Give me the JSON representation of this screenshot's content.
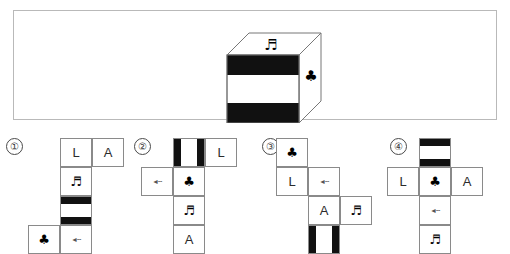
{
  "question": {
    "cube": {
      "top_face_symbol": "♬",
      "front_face": "striped-horizontal",
      "right_face_symbol": "♣"
    }
  },
  "options": [
    {
      "number": "①",
      "cells": [
        {
          "name": "cell-l",
          "type": "letter",
          "text": "L",
          "col": 0,
          "row": 0
        },
        {
          "name": "cell-a",
          "type": "letter",
          "text": "A",
          "col": 1,
          "row": 0
        },
        {
          "name": "cell-note",
          "type": "note",
          "text": "♬",
          "col": 0,
          "row": 1
        },
        {
          "name": "cell-striped",
          "type": "stripes-h",
          "text": "",
          "col": 0,
          "row": 2
        },
        {
          "name": "cell-club",
          "type": "club",
          "text": "♣",
          "col": -1,
          "row": 3
        },
        {
          "name": "cell-glyph",
          "type": "glyph",
          "text": "◄╌",
          "col": 0,
          "row": 3
        }
      ]
    },
    {
      "number": "②",
      "cells": [
        {
          "name": "cell-striped",
          "type": "stripes-v",
          "text": "",
          "col": 0,
          "row": 0
        },
        {
          "name": "cell-l",
          "type": "letter",
          "text": "L",
          "col": 1,
          "row": 0
        },
        {
          "name": "cell-glyph",
          "type": "glyph",
          "text": "◄╌",
          "col": -1,
          "row": 1
        },
        {
          "name": "cell-club",
          "type": "club",
          "text": "♣",
          "col": 0,
          "row": 1
        },
        {
          "name": "cell-note",
          "type": "note",
          "text": "♬",
          "col": 0,
          "row": 2
        },
        {
          "name": "cell-a",
          "type": "letter",
          "text": "A",
          "col": 0,
          "row": 3
        }
      ]
    },
    {
      "number": "③",
      "cells": [
        {
          "name": "cell-club",
          "type": "club",
          "text": "♣",
          "col": 0,
          "row": 0
        },
        {
          "name": "cell-l",
          "type": "letter",
          "text": "L",
          "col": 0,
          "row": 1
        },
        {
          "name": "cell-glyph",
          "type": "glyph",
          "text": "◄╌",
          "col": 1,
          "row": 1
        },
        {
          "name": "cell-a",
          "type": "letter",
          "text": "A",
          "col": 1,
          "row": 2
        },
        {
          "name": "cell-note",
          "type": "note",
          "text": "♬",
          "col": 2,
          "row": 2
        },
        {
          "name": "cell-striped",
          "type": "stripes-v",
          "text": "",
          "col": 1,
          "row": 3
        }
      ]
    },
    {
      "number": "④",
      "cells": [
        {
          "name": "cell-striped",
          "type": "stripes-h",
          "text": "",
          "col": 0,
          "row": 0
        },
        {
          "name": "cell-l",
          "type": "letter",
          "text": "L",
          "col": -1,
          "row": 1
        },
        {
          "name": "cell-club",
          "type": "club",
          "text": "♣",
          "col": 0,
          "row": 1
        },
        {
          "name": "cell-a",
          "type": "letter",
          "text": "A",
          "col": 1,
          "row": 1
        },
        {
          "name": "cell-glyph",
          "type": "glyph",
          "text": "◄╌",
          "col": 0,
          "row": 2
        },
        {
          "name": "cell-note",
          "type": "note",
          "text": "♬",
          "col": 0,
          "row": 3
        }
      ]
    }
  ],
  "layout": {
    "option_origins": [
      {
        "left": 60,
        "top": 8
      },
      {
        "left": 45,
        "top": 8
      },
      {
        "left": 20,
        "top": 8
      },
      {
        "left": 35,
        "top": 8
      }
    ],
    "option_lefts": [
      0,
      128,
      256,
      384
    ],
    "cell_w": 32,
    "cell_h": 29
  },
  "colors": {
    "ink": "#111111",
    "border": "#8a8a8a",
    "panel_border": "#b9b9b9",
    "text": "#222222"
  }
}
